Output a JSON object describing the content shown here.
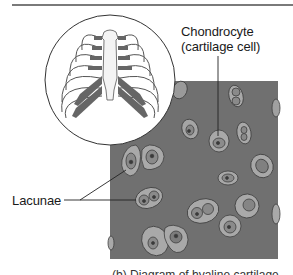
{
  "figure": {
    "inset": {
      "subject": "rib cage with costal cartilage",
      "shape": "circle"
    },
    "tissue_panel": {
      "background_color": "#707070",
      "cell_halo_color": "#a9a9a9",
      "cell_body_color": "#8c8c8c",
      "nucleus_color": "#3a3a3a"
    },
    "labels": {
      "chondrocyte_line1": "Chondrocyte",
      "chondrocyte_line2": "(cartilage cell)",
      "lacunae": "Lacunae"
    },
    "caption": "(b) Diagram of hyaline cartilage"
  }
}
